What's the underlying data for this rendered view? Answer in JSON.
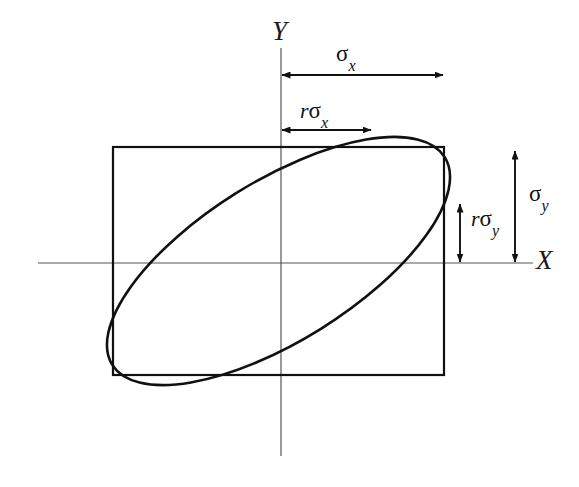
{
  "figure": {
    "type": "diagram",
    "background_color": "#ffffff",
    "stroke_color": "#111111",
    "axis_color": "#555555",
    "width": 579,
    "height": 487
  },
  "axes": {
    "x_label": "X",
    "y_label": "Y",
    "origin": {
      "x": 281,
      "y": 263
    },
    "x_axis": {
      "x1": 38,
      "y1": 263,
      "x2": 533,
      "y2": 263
    },
    "y_axis": {
      "x1": 281,
      "y1": 48,
      "x2": 281,
      "y2": 456
    }
  },
  "rectangle": {
    "name": "standard-deviation-bounding-box",
    "left": 113,
    "top": 147,
    "right": 444,
    "bottom": 375,
    "width": 331,
    "height": 228,
    "stroke_width": 2.2
  },
  "ellipse": {
    "name": "correlation-ellipse",
    "center_x": 278.5,
    "center_y": 261,
    "semi_major": 196,
    "semi_minor": 80,
    "rotation_deg": -32,
    "stroke_width": 2.6,
    "tangent_to": [
      "top",
      "right",
      "bottom",
      "left"
    ],
    "correlation_sign": "positive"
  },
  "annotations": [
    {
      "id": "sigma-x",
      "label_parts": {
        "r": "",
        "sigma": "σ",
        "subscript": "x"
      },
      "label_text": "σx",
      "orientation": "horizontal",
      "arrow": {
        "x1": 281,
        "y1": 75,
        "x2": 444,
        "y2": 75
      },
      "double_headed": true,
      "meaning": "standard deviation of X"
    },
    {
      "id": "r-sigma-x",
      "label_parts": {
        "r": "r",
        "sigma": "σ",
        "subscript": "x"
      },
      "label_text": "rσx",
      "orientation": "horizontal",
      "arrow": {
        "x1": 281,
        "y1": 130,
        "x2": 372,
        "y2": 130
      },
      "double_headed": true,
      "meaning": "correlation coefficient times standard deviation of X"
    },
    {
      "id": "sigma-y",
      "label_parts": {
        "r": "",
        "sigma": "σ",
        "subscript": "y"
      },
      "label_text": "σy",
      "orientation": "vertical",
      "arrow": {
        "x1": 515,
        "y1": 150,
        "x2": 515,
        "y2": 263
      },
      "double_headed": true,
      "meaning": "standard deviation of Y"
    },
    {
      "id": "r-sigma-y",
      "label_parts": {
        "r": "r",
        "sigma": "σ",
        "subscript": "y"
      },
      "label_text": "rσy",
      "orientation": "vertical",
      "arrow": {
        "x1": 460,
        "y1": 203,
        "x2": 460,
        "y2": 263
      },
      "double_headed": true,
      "meaning": "correlation coefficient times standard deviation of Y"
    }
  ]
}
